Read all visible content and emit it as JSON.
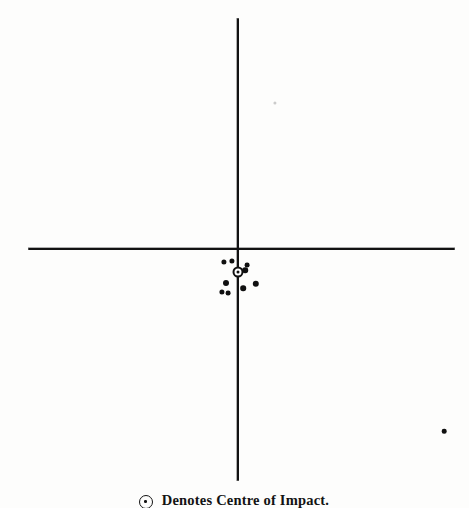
{
  "figure": {
    "background_color": "#fdfdfc",
    "ink_color": "#101010",
    "width": 469,
    "height": 508
  },
  "caption": {
    "symbol_name": "centre-of-impact-symbol",
    "text": "Denotes Centre of Impact.",
    "x_center": 234,
    "y": 492
  },
  "axes": {
    "horizontal": {
      "label": "horizontal-axis",
      "x_start": 28,
      "x_end": 455,
      "y": 248
    },
    "vertical": {
      "label": "vertical-axis",
      "x": 237,
      "y_start": 18,
      "y_end": 481
    }
  },
  "chart_data": {
    "type": "scatter",
    "title": "",
    "subtitle": "",
    "xlabel": "",
    "ylabel": "",
    "grid": false,
    "legend_position": "bottom",
    "axis_origin": {
      "x": 237,
      "y": 248
    },
    "xlim": [
      28,
      455
    ],
    "ylim": [
      481,
      18
    ],
    "annotations": [
      "Denotes Centre of Impact."
    ],
    "legend": [
      {
        "marker": "ringed-dot",
        "label": "Denotes Centre of Impact."
      }
    ],
    "series": [
      {
        "name": "Shot holes",
        "marker": "filled-dot",
        "color": "#101010",
        "points": [
          {
            "x": 224,
            "y": 262,
            "r": 2.6
          },
          {
            "x": 232,
            "y": 261,
            "r": 2.6
          },
          {
            "x": 247,
            "y": 265,
            "r": 2.4
          },
          {
            "x": 245,
            "y": 270,
            "r": 2.8
          },
          {
            "x": 226,
            "y": 283,
            "r": 3.0
          },
          {
            "x": 256,
            "y": 284,
            "r": 3.2
          },
          {
            "x": 243,
            "y": 288,
            "r": 2.8
          },
          {
            "x": 222,
            "y": 292,
            "r": 2.6
          },
          {
            "x": 228,
            "y": 293,
            "r": 2.4
          },
          {
            "x": 444,
            "y": 431,
            "r": 2.3
          }
        ]
      },
      {
        "name": "Faint print speck",
        "marker": "faint-dot",
        "color": "#5a5a5a",
        "points": [
          {
            "x": 275,
            "y": 103,
            "r": 1.6
          }
        ]
      }
    ],
    "centre_of_impact": {
      "name": "centre-of-impact",
      "x": 238,
      "y": 272,
      "outer_diameter": 11,
      "marker": "ringed-dot"
    }
  }
}
